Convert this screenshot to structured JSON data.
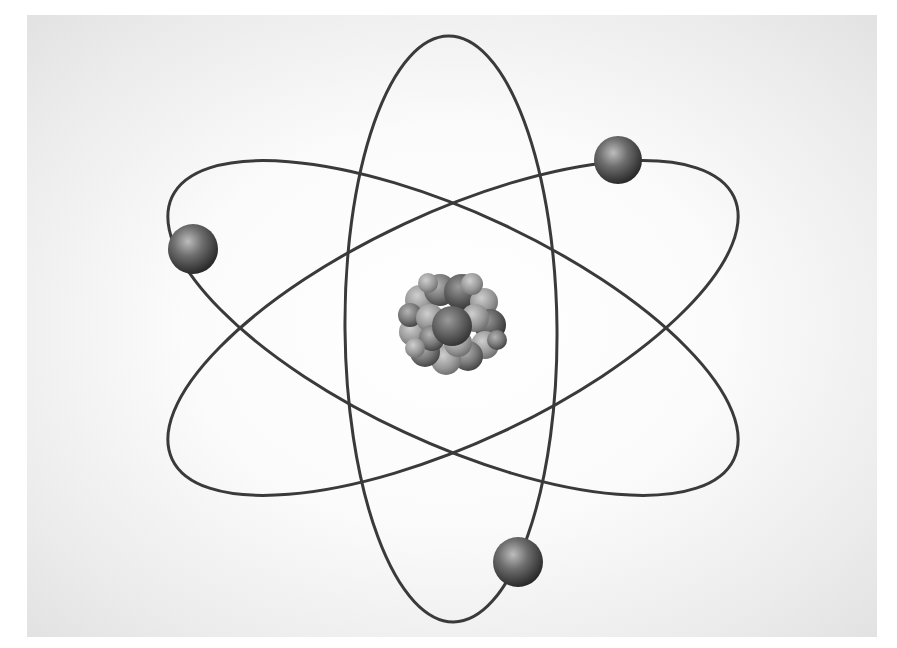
{
  "image": {
    "subject": "atom-model",
    "description": "Stylized Bohr/Rutherford atom with three elliptical orbits, three electrons and a clustered nucleus",
    "colors": {
      "background_center": "#ffffff",
      "background_edge": "#e2e2e2",
      "orbit_stroke": "#3a3a3a",
      "electron_highlight": "#b5b5b5",
      "electron_shadow": "#2e2e2e",
      "nucleus_light": "#a8a8a8",
      "nucleus_dark": "#3c3c3c"
    },
    "center": [
      453,
      328
    ],
    "orbits": [
      {
        "name": "orbit-vertical",
        "cx": 451,
        "cy": 329,
        "rx": 106,
        "ry": 293,
        "rotation": -0.5
      },
      {
        "name": "orbit-tilted-down",
        "cx": 453,
        "cy": 328,
        "rx": 310,
        "ry": 115,
        "rotation": 25
      },
      {
        "name": "orbit-tilted-up",
        "cx": 453,
        "cy": 328,
        "rx": 310,
        "ry": 115,
        "rotation": -25
      }
    ],
    "electrons": [
      {
        "name": "electron-left",
        "cx": 193,
        "cy": 249,
        "r": 25
      },
      {
        "name": "electron-top-right",
        "cx": 618,
        "cy": 160,
        "r": 24
      },
      {
        "name": "electron-bottom",
        "cx": 518,
        "cy": 562,
        "r": 25
      }
    ],
    "nucleus": {
      "cx": 453,
      "cy": 326,
      "r": 55
    }
  }
}
